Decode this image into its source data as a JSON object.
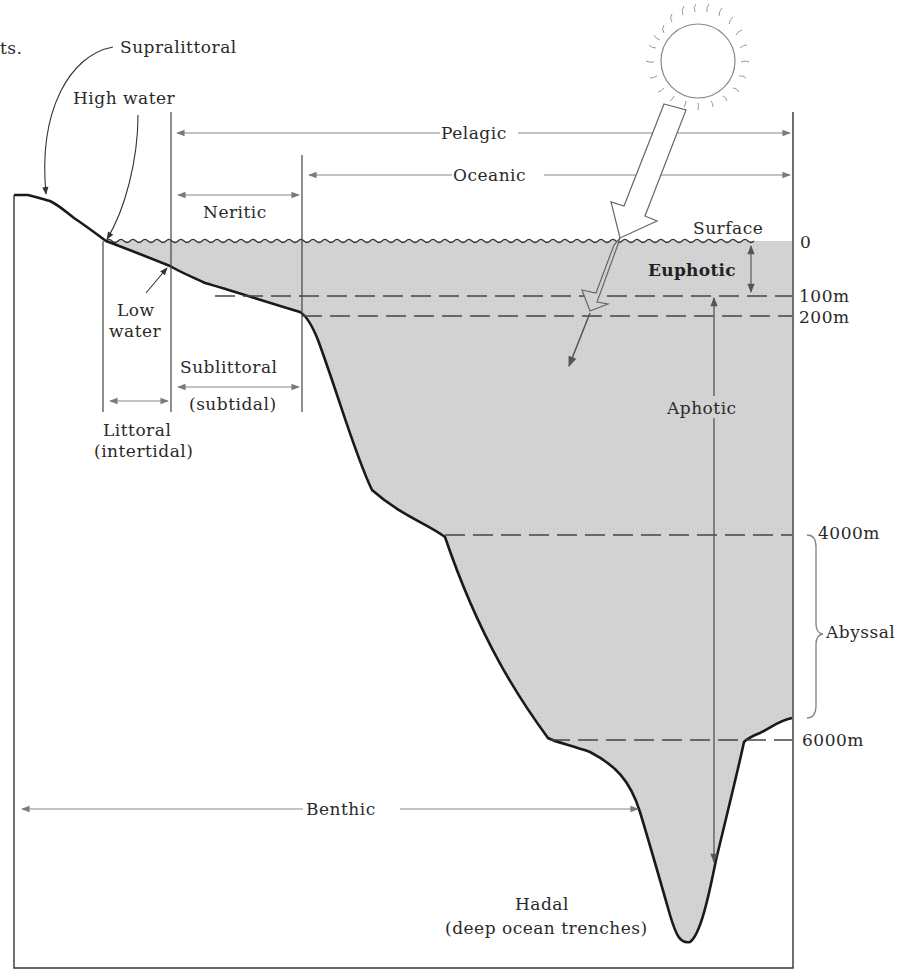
{
  "diagram": {
    "title_fragment": "ts.",
    "colors": {
      "water_fill": "#d3d3d3",
      "profile_line": "#1a1a1a",
      "guide_line": "#4a4a4a",
      "arrow": "#777777",
      "frame": "#333333"
    },
    "labels": {
      "supralittoral": "Supralittoral",
      "high_water": "High water",
      "low_water_1": "Low",
      "low_water_2": "water",
      "pelagic": "Pelagic",
      "oceanic": "Oceanic",
      "neritic": "Neritic",
      "surface": "Surface",
      "euphotic": "Euphotic",
      "aphotic": "Aphotic",
      "sublittoral": "Sublittoral",
      "subtidal": "(subtidal)",
      "littoral": "Littoral",
      "intertidal": "(intertidal)",
      "abyssal": "Abyssal",
      "benthic": "Benthic",
      "hadal": "Hadal",
      "hadal_sub": "(deep ocean trenches)"
    },
    "depth_scale": {
      "d0": "0",
      "d100": "100m",
      "d200": "200m",
      "d4000": "4000m",
      "d6000": "6000m"
    },
    "icons": {
      "sun": "sun-icon",
      "light_ray": "light-ray-arrow"
    }
  }
}
